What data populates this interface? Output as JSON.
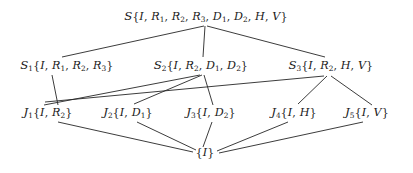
{
  "diagram": {
    "type": "hasse-lattice",
    "title": "",
    "canvas": {
      "width": 413,
      "height": 173
    },
    "line_color": "#262626",
    "text_color": "#1a1a1a",
    "background": "#ffffff",
    "nodes": [
      {
        "id": "S",
        "label": "℘{I, R₁, R₂, R₃, D₁, D₂, H, V}",
        "prefix": "S",
        "prefix_style": "script",
        "subscript": "",
        "members": [
          "I",
          "R1",
          "R2",
          "R3",
          "D1",
          "D2",
          "H",
          "V"
        ],
        "x": 206,
        "y": 17,
        "level": 0
      },
      {
        "id": "S1",
        "label": "S₁{I, R₁, R₂, R₃}",
        "prefix": "S",
        "prefix_style": "script",
        "subscript": "1",
        "members": [
          "I",
          "R1",
          "R2",
          "R3"
        ],
        "x": 67,
        "y": 66,
        "level": 1
      },
      {
        "id": "S2",
        "label": "S₂{I, R₂, D₁, D₂}",
        "prefix": "S",
        "prefix_style": "script",
        "subscript": "2",
        "members": [
          "I",
          "R2",
          "D1",
          "D2"
        ],
        "x": 201,
        "y": 66,
        "level": 1
      },
      {
        "id": "S3",
        "label": "S₃{I, R₂, H, V}",
        "prefix": "S",
        "prefix_style": "script",
        "subscript": "3",
        "members": [
          "I",
          "R2",
          "H",
          "V"
        ],
        "x": 331,
        "y": 66,
        "level": 1
      },
      {
        "id": "J1",
        "label": "J₁{I, R₂}",
        "prefix": "J",
        "prefix_style": "fraktur",
        "subscript": "1",
        "members": [
          "I",
          "R2"
        ],
        "x": 48,
        "y": 113,
        "level": 2
      },
      {
        "id": "J2",
        "label": "J₂{I, D₁}",
        "prefix": "J",
        "prefix_style": "fraktur",
        "subscript": "2",
        "members": [
          "I",
          "D1"
        ],
        "x": 128,
        "y": 113,
        "level": 2
      },
      {
        "id": "J3",
        "label": "J₃{I, D₂}",
        "prefix": "J",
        "prefix_style": "fraktur",
        "subscript": "3",
        "members": [
          "I",
          "D2"
        ],
        "x": 211,
        "y": 113,
        "level": 2
      },
      {
        "id": "J4",
        "label": "J₄{I, H}",
        "prefix": "J",
        "prefix_style": "fraktur",
        "subscript": "4",
        "members": [
          "I",
          "H"
        ],
        "x": 294,
        "y": 113,
        "level": 2
      },
      {
        "id": "J5",
        "label": "J₅{I, V}",
        "prefix": "J",
        "prefix_style": "fraktur",
        "subscript": "5",
        "members": [
          "I",
          "V"
        ],
        "x": 367,
        "y": 113,
        "level": 2
      },
      {
        "id": "I",
        "label": "{I}",
        "prefix": "",
        "prefix_style": "none",
        "subscript": "",
        "members": [
          "I"
        ],
        "x": 205,
        "y": 153,
        "level": 3
      }
    ],
    "edges": [
      {
        "from": "S",
        "to": "S1",
        "x1": 204,
        "y1": 26,
        "x2": 62,
        "y2": 57
      },
      {
        "from": "S",
        "to": "S2",
        "x1": 205,
        "y1": 26,
        "x2": 203,
        "y2": 57
      },
      {
        "from": "S",
        "to": "S3",
        "x1": 207,
        "y1": 26,
        "x2": 325,
        "y2": 57
      },
      {
        "from": "S1",
        "to": "J1",
        "x1": 52,
        "y1": 75,
        "x2": 58,
        "y2": 105
      },
      {
        "from": "S2",
        "to": "J1",
        "x1": 200,
        "y1": 75,
        "x2": 44,
        "y2": 105
      },
      {
        "from": "S2",
        "to": "J2",
        "x1": 202,
        "y1": 75,
        "x2": 134,
        "y2": 104
      },
      {
        "from": "S2",
        "to": "J3",
        "x1": 204,
        "y1": 75,
        "x2": 213,
        "y2": 105
      },
      {
        "from": "S3",
        "to": "J1",
        "x1": 324,
        "y1": 76,
        "x2": 45,
        "y2": 102
      },
      {
        "from": "S3",
        "to": "J4",
        "x1": 327,
        "y1": 76,
        "x2": 298,
        "y2": 104
      },
      {
        "from": "S3",
        "to": "J5",
        "x1": 331,
        "y1": 76,
        "x2": 372,
        "y2": 105
      },
      {
        "from": "J1",
        "to": "I",
        "x1": 58,
        "y1": 122,
        "x2": 193,
        "y2": 152
      },
      {
        "from": "J2",
        "to": "I",
        "x1": 137,
        "y1": 122,
        "x2": 196,
        "y2": 150
      },
      {
        "from": "J3",
        "to": "I",
        "x1": 212,
        "y1": 122,
        "x2": 203,
        "y2": 147
      },
      {
        "from": "J4",
        "to": "I",
        "x1": 288,
        "y1": 122,
        "x2": 217,
        "y2": 151
      },
      {
        "from": "J5",
        "to": "I",
        "x1": 363,
        "y1": 122,
        "x2": 219,
        "y2": 153
      }
    ]
  }
}
